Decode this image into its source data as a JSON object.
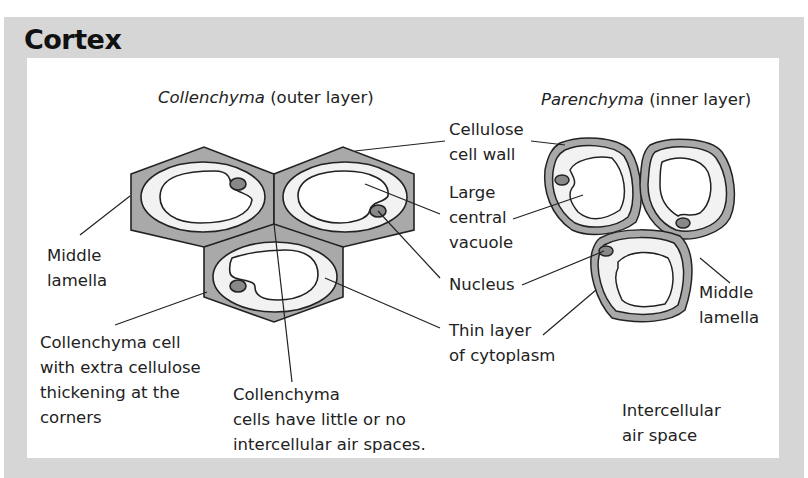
{
  "title": "Cortex",
  "colors": {
    "panel_bg": "#d6d6d6",
    "inner_bg": "#ffffff",
    "wall_fill": "#a9a9a9",
    "cytoplasm_fill": "#f2f2f2",
    "nucleus_fill": "#888888",
    "outline": "#222222"
  },
  "sections": {
    "collenchyma": {
      "name": "Collenchyma",
      "qualifier": "(outer layer)"
    },
    "parenchyma": {
      "name": "Parenchyma",
      "qualifier": "(inner layer)"
    }
  },
  "labels": {
    "cellulose_wall": [
      "Cellulose",
      "cell wall"
    ],
    "vacuole": [
      "Large",
      "central",
      "vacuole"
    ],
    "nucleus": "Nucleus",
    "cytoplasm": [
      "Thin layer",
      "of cytoplasm"
    ],
    "middle_lamella_left": [
      "Middle",
      "lamella"
    ],
    "middle_lamella_right": [
      "Middle",
      "lamella"
    ],
    "collenchyma_cell": [
      "Collenchyma cell",
      "with extra cellulose",
      "thickening at the",
      "corners"
    ],
    "air_spaces": [
      "Collenchyma",
      "cells have little or no",
      "intercellular air spaces."
    ],
    "intercellular": [
      "Intercellular",
      "air space"
    ]
  }
}
